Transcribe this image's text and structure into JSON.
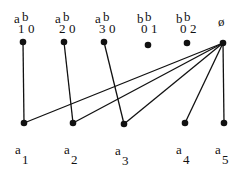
{
  "diagram": {
    "type": "bipartite-graph",
    "top_nodes": [
      {
        "id": "a1b0",
        "x": 23,
        "y": 42,
        "parts": [
          {
            "t": "a",
            "dx": -9,
            "dy": -30
          },
          {
            "t": "b",
            "dx": -1,
            "dy": -32
          },
          {
            "t": "1",
            "dx": -5,
            "dy": -20
          },
          {
            "t": "0",
            "dx": 5,
            "dy": -20
          }
        ]
      },
      {
        "id": "a2b0",
        "x": 64,
        "y": 42,
        "parts": [
          {
            "t": "a",
            "dx": -9,
            "dy": -30
          },
          {
            "t": "b",
            "dx": -1,
            "dy": -32
          },
          {
            "t": "2",
            "dx": -5,
            "dy": -20
          },
          {
            "t": "0",
            "dx": 5,
            "dy": -20
          }
        ]
      },
      {
        "id": "a3b0",
        "x": 104,
        "y": 42,
        "parts": [
          {
            "t": "a",
            "dx": -9,
            "dy": -30
          },
          {
            "t": "b",
            "dx": -1,
            "dy": -32
          },
          {
            "t": "3",
            "dx": -5,
            "dy": -20
          },
          {
            "t": "0",
            "dx": 5,
            "dy": -20
          }
        ]
      },
      {
        "id": "b0b1",
        "x": 148,
        "y": 45,
        "parts": [
          {
            "t": "b",
            "dx": -11,
            "dy": -33
          },
          {
            "t": "b",
            "dx": -3,
            "dy": -35
          },
          {
            "t": "0",
            "dx": -7,
            "dy": -23
          },
          {
            "t": "1",
            "dx": 3,
            "dy": -23
          }
        ]
      },
      {
        "id": "b0b2",
        "x": 187,
        "y": 43,
        "parts": [
          {
            "t": "b",
            "dx": -11,
            "dy": -31
          },
          {
            "t": "b",
            "dx": -3,
            "dy": -33
          },
          {
            "t": "0",
            "dx": -7,
            "dy": -21
          },
          {
            "t": "2",
            "dx": 3,
            "dy": -21
          }
        ]
      },
      {
        "id": "empty",
        "x": 223,
        "y": 43,
        "parts": [
          {
            "t": "ø",
            "dx": -5,
            "dy": -28
          }
        ]
      }
    ],
    "bottom_nodes": [
      {
        "id": "a1",
        "x": 24,
        "y": 123,
        "letter": "a",
        "index": "1"
      },
      {
        "id": "a2",
        "x": 73,
        "y": 123,
        "letter": "a",
        "index": "2"
      },
      {
        "id": "a3",
        "x": 124,
        "y": 124,
        "letter": "a",
        "index": "3"
      },
      {
        "id": "a4",
        "x": 185,
        "y": 123,
        "letter": "a",
        "index": "4"
      },
      {
        "id": "a5",
        "x": 224,
        "y": 123,
        "letter": "a",
        "index": "5"
      }
    ],
    "edges": [
      [
        "a1b0",
        "a1"
      ],
      [
        "a2b0",
        "a2"
      ],
      [
        "a3b0",
        "a3"
      ],
      [
        "empty",
        "a1"
      ],
      [
        "empty",
        "a2"
      ],
      [
        "empty",
        "a3"
      ],
      [
        "empty",
        "a4"
      ],
      [
        "empty",
        "a5"
      ]
    ],
    "colors": {
      "ink": "#111111",
      "background": "#ffffff"
    }
  }
}
